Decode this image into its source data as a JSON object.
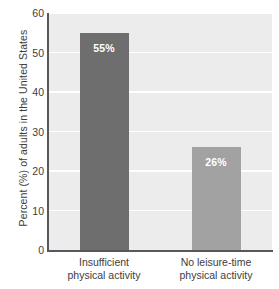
{
  "chart_data": {
    "type": "bar",
    "title": "",
    "xlabel": "",
    "ylabel": "Percent (%) of adults in the United States",
    "ylim": [
      0,
      60
    ],
    "yticks": [
      0,
      10,
      20,
      30,
      40,
      50,
      60
    ],
    "ytick_labels": [
      "0",
      "10",
      "20",
      "30",
      "40",
      "50",
      "60"
    ],
    "grid": "horizontal",
    "legend": "none",
    "categories": [
      "Insufficient physical activity",
      "No leisure-time physical activity"
    ],
    "category_lines": [
      [
        "Insufficient",
        "physical activity"
      ],
      [
        "No leisure-time",
        "physical activity"
      ]
    ],
    "values": [
      55,
      26
    ],
    "data_labels": [
      "55%",
      "26%"
    ],
    "bar_colors": [
      "#6e6e6e",
      "#a2a2a2"
    ],
    "plot_background": "#ececec",
    "gridline_color": "#ffffff",
    "axis_color": "#55585c"
  },
  "axis": {
    "y_title": "Percent (%) of adults in the United States"
  }
}
